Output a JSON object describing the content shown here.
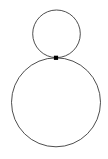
{
  "figure": {
    "title": "Two externally tangent circles",
    "background_color": "#ffffff",
    "width": 108,
    "height": 159
  },
  "style": {
    "stroke_color": "#3a3a3a",
    "stroke_width": 0.9,
    "fill": "none",
    "point_color": "#000000"
  },
  "shapes": {
    "small_circle": {
      "label": "small circle",
      "cx": 56.5,
      "cy": 33.8,
      "r": 23.8
    },
    "large_circle": {
      "label": "large circle",
      "cx": 56.0,
      "cy": 102.3,
      "r": 44.5
    },
    "tangency_point": {
      "label": "tangency point",
      "cx": 56.0,
      "cy": 57.8,
      "size": 4.2
    }
  }
}
